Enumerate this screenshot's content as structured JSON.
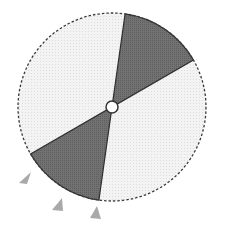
{
  "diagram": {
    "type": "sector-wheel",
    "center": {
      "x": 112,
      "y": 107
    },
    "radius": 94,
    "hub_radius": 6,
    "colors": {
      "background": "#ffffff",
      "light_fill": "#f1f1f1",
      "dark_fill": "#6e6e6e",
      "outline": "#3a3a3a",
      "marker": "#a9a9a9"
    },
    "sectors": [
      {
        "name": "top-dark-sector",
        "start_deg": -82,
        "end_deg": -30
      },
      {
        "name": "bottom-dark-sector",
        "start_deg": 98,
        "end_deg": 150
      }
    ],
    "markers": [
      {
        "name": "marker-1",
        "points": "19,183 31,172 27,184"
      },
      {
        "name": "marker-2",
        "points": "52,210 62,198 63,211"
      },
      {
        "name": "marker-3",
        "points": "90,218 97,206 101,219"
      }
    ]
  }
}
